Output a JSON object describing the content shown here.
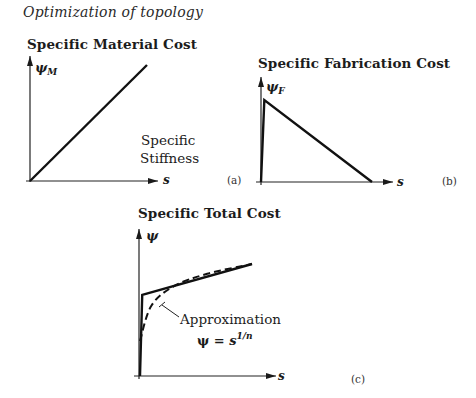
{
  "header": "Optimization of topology",
  "panels": {
    "a": {
      "title": "Specific Material Cost",
      "y_label": "ψ",
      "y_sub": "M",
      "x_label": "s",
      "annotation_line1": "Specific",
      "annotation_line2": "Stiffness",
      "panel_label": "(a)"
    },
    "b": {
      "title": "Specific Fabrication Cost",
      "y_label": "ψ",
      "y_sub": "F",
      "x_label": "s",
      "panel_label": "(b)"
    },
    "c": {
      "title": "Specific Total Cost",
      "y_label": "ψ",
      "x_label": "s",
      "annotation": "Approximation",
      "formula_lhs": "ψ = ",
      "formula_base": "s",
      "formula_exp": "1/n",
      "panel_label": "(c)"
    }
  },
  "chart_data": [
    {
      "type": "line",
      "title": "Specific Material Cost",
      "xlabel": "s",
      "ylabel": "ψ_M",
      "annotation": "Specific Stiffness",
      "series": [
        {
          "name": "ψ_M",
          "style": "solid",
          "x": [
            0,
            1
          ],
          "y": [
            0,
            1
          ]
        }
      ]
    },
    {
      "type": "line",
      "title": "Specific Fabrication Cost",
      "xlabel": "s",
      "ylabel": "ψ_F",
      "series": [
        {
          "name": "ψ_F",
          "style": "solid",
          "x": [
            0,
            0.03,
            1
          ],
          "y": [
            0,
            1,
            0
          ]
        }
      ]
    },
    {
      "type": "line",
      "title": "Specific Total Cost",
      "xlabel": "s",
      "ylabel": "ψ",
      "annotations": [
        "Approximation",
        "ψ = s^(1/n)"
      ],
      "series": [
        {
          "name": "ψ (total)",
          "style": "solid",
          "x": [
            0,
            0.02,
            1
          ],
          "y": [
            0,
            0.58,
            0.8
          ]
        },
        {
          "name": "Approximation ψ = s^(1/n)",
          "style": "dashed",
          "x": [
            0,
            0.1,
            0.3,
            0.6,
            1
          ],
          "y": [
            0.25,
            0.5,
            0.64,
            0.73,
            0.8
          ]
        }
      ]
    }
  ]
}
